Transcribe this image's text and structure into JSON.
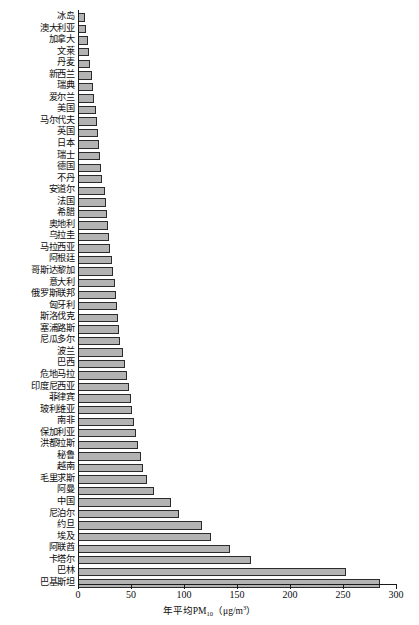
{
  "chart_data": {
    "type": "bar",
    "orientation": "horizontal",
    "title": "",
    "xlabel": "年平均PM10（μg/m³）",
    "xlabel_parts": {
      "prefix": "年平均PM",
      "sub": "10",
      "open": "（μg/m",
      "sup": "3",
      "close": "）"
    },
    "ylabel": "",
    "xlim": [
      0,
      300
    ],
    "xticks": [
      0,
      50,
      100,
      150,
      200,
      250,
      300
    ],
    "xticklabels": [
      "0",
      "50",
      "100",
      "150",
      "200",
      "250",
      "300"
    ],
    "grid": false,
    "legend": null,
    "bar_fill_color": "#b3b3b3",
    "bar_edge_color": "#2b2b2b",
    "axis_color": "#1a1a1a",
    "categories": [
      "冰岛",
      "澳大利亚",
      "加拿大",
      "文莱",
      "丹麦",
      "新西兰",
      "瑞典",
      "爱尔兰",
      "美国",
      "马尔代夫",
      "英国",
      "日本",
      "瑞士",
      "德国",
      "不丹",
      "安道尔",
      "法国",
      "希腊",
      "奥地利",
      "乌拉圭",
      "马拉西亚",
      "阿根廷",
      "哥斯达黎加",
      "意大利",
      "俄罗斯联邦",
      "匈牙利",
      "斯洛伐克",
      "塞浦路斯",
      "尼瓜多尔",
      "波兰",
      "巴西",
      "危地马拉",
      "印度尼西亚",
      "菲律宾",
      "玻利维亚",
      "南非",
      "保加利亚",
      "洪都拉斯",
      "秘鲁",
      "越南",
      "毛里求斯",
      "阿曼",
      "中国",
      "尼泊尔",
      "约旦",
      "埃及",
      "阿联酋",
      "卡塔尔",
      "巴林",
      "巴基斯坦"
    ],
    "values": [
      7,
      8,
      9,
      10,
      11,
      13,
      14,
      15,
      17,
      18,
      19,
      20,
      21,
      22,
      23,
      25,
      26,
      27,
      28,
      29,
      30,
      32,
      33,
      35,
      36,
      37,
      38,
      39,
      40,
      42,
      44,
      46,
      48,
      50,
      51,
      53,
      55,
      57,
      59,
      61,
      65,
      72,
      88,
      95,
      117,
      125,
      143,
      163,
      253,
      285
    ]
  }
}
